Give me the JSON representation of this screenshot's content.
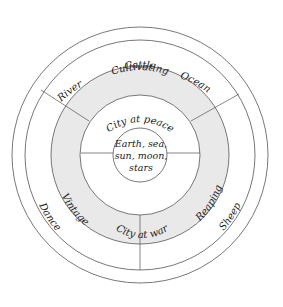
{
  "diagram": {
    "center": [
      "Earth, sea,",
      "sun, moon,",
      "stars"
    ],
    "inner_ring": {
      "top": "City at peace",
      "bottom": "City at war"
    },
    "gray_ring": {
      "top": "Cultivating",
      "right": "Reaping",
      "left": "Vintage"
    },
    "outer_band": {
      "top": "Cattle",
      "right": "Sheep",
      "left": "Dance"
    },
    "rim": {
      "left": "River",
      "right": "Ocean"
    },
    "colors": {
      "gray_ring": "#e9e9e9",
      "line": "#555555"
    }
  }
}
